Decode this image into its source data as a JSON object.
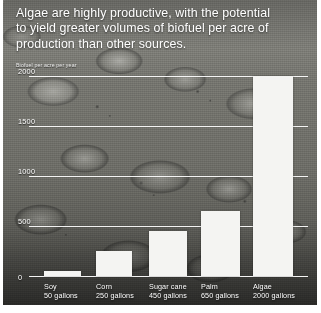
{
  "title": {
    "line1": "Algae are highly productive, with the potential",
    "line2": "to yield greater volumes of biofuel per acre of",
    "line3": "production than other sources."
  },
  "axis_label": "Biofuel per acre per year",
  "colors": {
    "bar": "#f4f4f2",
    "text": "#ffffff",
    "gridline": "#ffffff",
    "background": "#6e6e6e"
  },
  "chart_data": {
    "type": "bar",
    "title": "Algae are highly productive, with the potential to yield greater volumes of biofuel per acre of production than other sources.",
    "xlabel": "",
    "ylabel": "Biofuel per acre per year",
    "ylim": [
      0,
      2000
    ],
    "yticks": [
      0,
      500,
      1000,
      1500,
      2000
    ],
    "ytick_labels": [
      "0",
      "500",
      "1000",
      "1500",
      "2000"
    ],
    "grid": true,
    "legend": "none",
    "unit": "gallons",
    "categories": [
      "Soy",
      "Corn",
      "Sugar cane",
      "Palm",
      "Algae"
    ],
    "values": [
      50,
      250,
      450,
      650,
      2000
    ],
    "value_labels": [
      "50 gallons",
      "250 gallons",
      "450 gallons",
      "650 gallons",
      "2000 gallons"
    ]
  }
}
